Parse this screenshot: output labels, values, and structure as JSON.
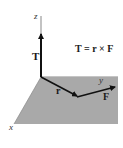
{
  "diagram": {
    "type": "vector-cross-product",
    "equation": "T = r × F",
    "axes": {
      "x_label": "x",
      "y_label": "y",
      "z_label": "z"
    },
    "vectors": [
      {
        "name": "torque",
        "label": "T",
        "direction": "along z-axis"
      },
      {
        "name": "position",
        "label": "r",
        "direction": "in xy-plane"
      },
      {
        "name": "force",
        "label": "F",
        "direction": "in xy-plane"
      }
    ],
    "colors": {
      "plane": "#a9a9a9",
      "vector": "#111111",
      "axis": "#555555",
      "background": "#ffffff"
    }
  }
}
